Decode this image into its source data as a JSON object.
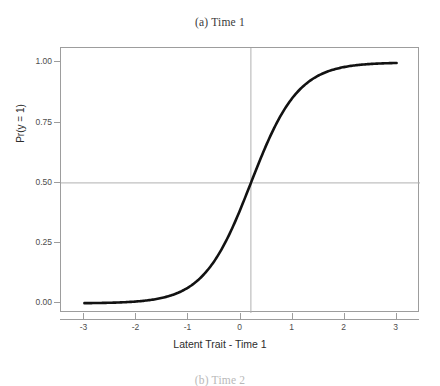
{
  "figure": {
    "caption_top": "(a) Time 1",
    "caption_bottom": "(b) Time 2",
    "background_color": "#ffffff"
  },
  "chart_data": {
    "type": "line",
    "title": "(a) Time 1",
    "xlabel": "Latent Trait - Time 1",
    "ylabel": "Pr(y = 1)",
    "xlim": [
      -3.45,
      3.45
    ],
    "ylim": [
      -0.04,
      1.06
    ],
    "xticks": [
      -3,
      -2,
      -1,
      0,
      1,
      2,
      3
    ],
    "xticklabels": [
      "-3",
      "-2",
      "-1",
      "0",
      "1",
      "2",
      "3"
    ],
    "yticks": [
      0.0,
      0.25,
      0.5,
      0.75,
      1.0
    ],
    "yticklabels": [
      "0.00",
      "0.25",
      "0.50",
      "0.75",
      "1.00"
    ],
    "grid": false,
    "legend": null,
    "curve_color": "#121212",
    "curve_width": 2.6,
    "reference_line_color": "#b0b0b0",
    "frame_color": "#9d9d9d",
    "reference_lines": [
      {
        "orientation": "horizontal",
        "value": 0.5
      },
      {
        "orientation": "vertical",
        "value": 0.2
      }
    ],
    "model": {
      "form": "logistic",
      "discrimination": 2.2,
      "difficulty": 0.2
    },
    "series": [
      {
        "name": "Item characteristic curve",
        "x": [
          -3.0,
          -2.8,
          -2.6,
          -2.4,
          -2.2,
          -2.0,
          -1.8,
          -1.6,
          -1.4,
          -1.2,
          -1.0,
          -0.8,
          -0.6,
          -0.4,
          -0.2,
          0.0,
          0.2,
          0.4,
          0.6,
          0.8,
          1.0,
          1.2,
          1.4,
          1.6,
          1.8,
          2.0,
          2.2,
          2.4,
          2.6,
          2.8,
          3.0
        ],
        "values": [
          0.001,
          0.002,
          0.003,
          0.005,
          0.007,
          0.012,
          0.018,
          0.029,
          0.045,
          0.069,
          0.104,
          0.154,
          0.222,
          0.309,
          0.414,
          0.392,
          0.5,
          0.608,
          0.708,
          0.793,
          0.858,
          0.905,
          0.938,
          0.96,
          0.974,
          0.983,
          0.989,
          0.993,
          0.995,
          0.997,
          0.998
        ]
      }
    ]
  },
  "axes": {
    "y": {
      "title": "Pr(y = 1)",
      "ticks": [
        {
          "label": "1.00",
          "value": 1.0
        },
        {
          "label": "0.75",
          "value": 0.75
        },
        {
          "label": "0.50",
          "value": 0.5
        },
        {
          "label": "0.25",
          "value": 0.25
        },
        {
          "label": "0.00",
          "value": 0.0
        }
      ]
    },
    "x": {
      "title": "Latent Trait - Time 1",
      "ticks": [
        {
          "label": "-3",
          "value": -3
        },
        {
          "label": "-2",
          "value": -2
        },
        {
          "label": "-1",
          "value": -1
        },
        {
          "label": "0",
          "value": 0
        },
        {
          "label": "1",
          "value": 1
        },
        {
          "label": "2",
          "value": 2
        },
        {
          "label": "3",
          "value": 3
        }
      ]
    }
  }
}
